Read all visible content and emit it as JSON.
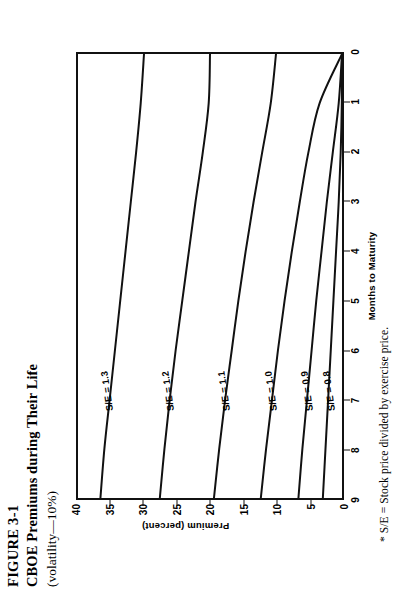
{
  "figure": {
    "number": "FIGURE 3-1",
    "title": "CBOE Premiums during Their Life",
    "subtitle": "(volatility—10%)",
    "footnote": "* S/E = Stock price divided by exercise price."
  },
  "axes": {
    "ylabel": "Premium (percent)",
    "xlabel": "Months to Maturity",
    "yticks": [
      "40",
      "35",
      "30",
      "25",
      "20",
      "15",
      "10",
      "5",
      "0"
    ],
    "xticks": [
      "9",
      "8",
      "7",
      "6",
      "5",
      "4",
      "3",
      "2",
      "1",
      "0"
    ]
  },
  "curve_labels": [
    "S/E = 1.3",
    "S/E = 1.2",
    "S/E = 1.1",
    "S/E = 1.0",
    "S/E = 0.9",
    "S/E = 0.8"
  ],
  "chart_data": {
    "type": "line",
    "title": "CBOE Premiums during Their Life",
    "subtitle": "(volatility—10%)",
    "xlabel": "Months to Maturity",
    "ylabel": "Premium (percent)",
    "xlim": [
      9,
      0
    ],
    "ylim": [
      0,
      40
    ],
    "x_direction": "decreasing left-to-right (time decays toward maturity at right)",
    "grid": false,
    "legend": "inline curve labels",
    "x": [
      9,
      8,
      7,
      6,
      5,
      4,
      3,
      2,
      1,
      0
    ],
    "series": [
      {
        "name": "S/E = 1.3",
        "values": [
          36.6,
          36.0,
          35.2,
          34.4,
          33.6,
          32.8,
          32.0,
          31.2,
          30.5,
          30.0
        ]
      },
      {
        "name": "S/E = 1.2",
        "values": [
          27.6,
          26.9,
          26.1,
          25.2,
          24.2,
          23.2,
          22.2,
          21.1,
          20.2,
          20.0
        ]
      },
      {
        "name": "S/E = 1.1",
        "values": [
          19.4,
          18.6,
          17.7,
          16.7,
          15.7,
          14.6,
          13.4,
          12.1,
          10.8,
          10.0
        ]
      },
      {
        "name": "S/E = 1.0",
        "values": [
          12.3,
          11.5,
          10.6,
          9.7,
          8.7,
          7.6,
          6.4,
          5.1,
          3.4,
          0.0
        ]
      },
      {
        "name": "S/E = 0.9",
        "values": [
          6.6,
          6.0,
          5.3,
          4.6,
          3.9,
          3.1,
          2.3,
          1.4,
          0.5,
          0.0
        ]
      },
      {
        "name": "S/E = 0.8",
        "values": [
          2.9,
          2.5,
          2.1,
          1.7,
          1.3,
          0.9,
          0.5,
          0.2,
          0.03,
          0.0
        ]
      }
    ]
  }
}
